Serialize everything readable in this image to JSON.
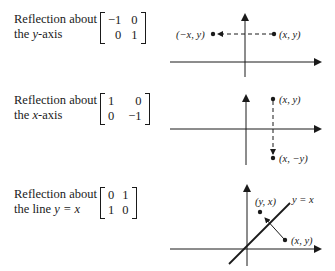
{
  "reflections": [
    {
      "label_line1": "Reflection about",
      "label_line2_prefix": "the ",
      "label_line2_var": "y",
      "label_line2_suffix": "-axis",
      "matrix": [
        [
          "−1",
          "0"
        ],
        [
          "0",
          "1"
        ]
      ],
      "points": {
        "original": "(x, y)",
        "image": "(−x, y)"
      }
    },
    {
      "label_line1": "Reflection about",
      "label_line2_prefix": "the ",
      "label_line2_var": "x",
      "label_line2_suffix": "-axis",
      "matrix": [
        [
          "1",
          "0"
        ],
        [
          "0",
          "−1"
        ]
      ],
      "points": {
        "original": "(x, y)",
        "image": "(x, −y)"
      }
    },
    {
      "label_line1": "Reflection about",
      "label_line2_prefix": "the line ",
      "label_line2_var": "y = x",
      "label_line2_suffix": "",
      "matrix": [
        [
          "0",
          "1"
        ],
        [
          "1",
          "0"
        ]
      ],
      "points": {
        "original": "(x, y)",
        "image": "(y, x)"
      },
      "line_label": "y = x"
    }
  ]
}
